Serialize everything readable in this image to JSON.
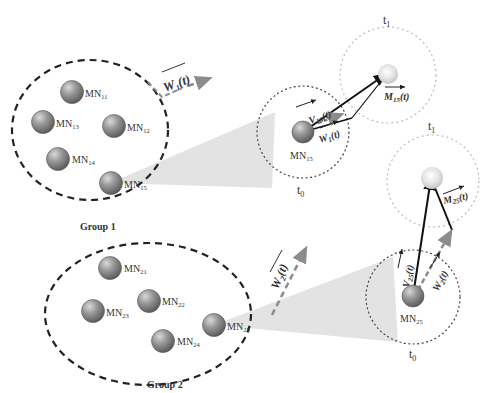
{
  "diagram": {
    "groups": [
      {
        "label": "Group 1",
        "nodes": [
          {
            "id": "MN11",
            "base": "MN",
            "sub": "11"
          },
          {
            "id": "MN13",
            "base": "MN",
            "sub": "13"
          },
          {
            "id": "MN12",
            "base": "MN",
            "sub": "12"
          },
          {
            "id": "MN14",
            "base": "MN",
            "sub": "14"
          },
          {
            "id": "MN15",
            "base": "MN",
            "sub": "15"
          }
        ],
        "group_vector": {
          "base": "W",
          "sub": "1",
          "arg": "(t)"
        }
      },
      {
        "label": "Group 2",
        "nodes": [
          {
            "id": "MN21",
            "base": "MN",
            "sub": "21"
          },
          {
            "id": "MN23",
            "base": "MN",
            "sub": "23"
          },
          {
            "id": "MN22",
            "base": "MN",
            "sub": "22"
          },
          {
            "id": "MN24",
            "base": "MN",
            "sub": "24"
          },
          {
            "id": "MN25",
            "base": "MN",
            "sub": "25"
          }
        ],
        "group_vector": {
          "base": "W",
          "sub": "2",
          "arg": "(t)"
        }
      }
    ],
    "zoom_views": [
      {
        "node": {
          "base": "MN",
          "sub": "15"
        },
        "t0_label": "t0",
        "t1_label": "t1",
        "velocity": {
          "base": "V",
          "sub": "15",
          "arg": "(t)"
        },
        "group_velocity": {
          "base": "W",
          "sub": "1",
          "arg": "(t)"
        },
        "motion": {
          "base": "M",
          "sub": "15",
          "arg": "(t)"
        }
      },
      {
        "node": {
          "base": "MN",
          "sub": "25"
        },
        "t0_label": "t0",
        "t1_label": "t1",
        "velocity": {
          "base": "V",
          "sub": "25",
          "arg": "(t)"
        },
        "group_velocity": {
          "base": "W",
          "sub": "2",
          "arg": "(t)"
        },
        "motion": {
          "base": "M",
          "sub": "25",
          "arg": "(t)"
        }
      }
    ],
    "time_labels": {
      "t0_base": "t",
      "t0_sub": "0",
      "t1_base": "t",
      "t1_sub": "1"
    }
  },
  "colors": {
    "node_fill": "#8a8a8a",
    "node_highlight": "#c8c8c8",
    "ghost_node": "#e6e6e6",
    "dashed_group": "#222222",
    "dotted_circle": "#bbbbbb",
    "zoom_cone": "#e3e3e3",
    "arrow_grey": "#8c8c8c",
    "arrow_black": "#111111"
  }
}
